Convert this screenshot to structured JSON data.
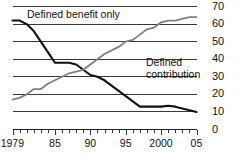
{
  "chart_data": {
    "type": "line",
    "title": "",
    "subtitle": "",
    "xlabel": "",
    "ylabel": "",
    "xlim": [
      1979,
      2005
    ],
    "ylim": [
      0,
      70
    ],
    "grid": true,
    "legend_position": "inline-annotation",
    "y_ticks": [
      70,
      60,
      50,
      40,
      30,
      20,
      10,
      0
    ],
    "x_ticks": [
      1979,
      1980,
      1981,
      1982,
      1983,
      1984,
      1985,
      1986,
      1987,
      1988,
      1989,
      1990,
      1991,
      1992,
      1993,
      1994,
      1995,
      1996,
      1997,
      1998,
      1999,
      2000,
      2001,
      2002,
      2003,
      2004,
      2005
    ],
    "x_tick_labels": [
      "1979",
      "85",
      "90",
      "95",
      "2000",
      "05"
    ],
    "x_tick_label_years": [
      1979,
      1985,
      1990,
      1995,
      2000,
      2005
    ],
    "annotations": [
      {
        "name": "defined-benefit-label",
        "text": "Defined benefit only",
        "x": 1980.5,
        "y": 66
      },
      {
        "name": "defined-contribution-label",
        "text": "Defined contribution",
        "lines": [
          "Defined",
          "contribution"
        ],
        "x": 1995,
        "y": 42
      }
    ],
    "series": [
      {
        "name": "Defined benefit only",
        "color": "#111111",
        "x": [
          1979,
          1980,
          1981,
          1982,
          1983,
          1984,
          1985,
          1986,
          1987,
          1988,
          1989,
          1990,
          1991,
          1992,
          1993,
          1994,
          1995,
          1996,
          1997,
          1998,
          1999,
          2000,
          2001,
          2002,
          2003,
          2004,
          2005
        ],
        "values": [
          62,
          62,
          60,
          56,
          50,
          44,
          38,
          38,
          38,
          37,
          34,
          31,
          30,
          28,
          25,
          22,
          19,
          16,
          13,
          13,
          13,
          13,
          13.5,
          13,
          12,
          11,
          10
        ]
      },
      {
        "name": "Defined contribution",
        "color": "#808080",
        "x": [
          1979,
          1980,
          1981,
          1982,
          1983,
          1984,
          1985,
          1986,
          1987,
          1988,
          1989,
          1990,
          1991,
          1992,
          1993,
          1994,
          1995,
          1996,
          1997,
          1998,
          1999,
          2000,
          2001,
          2002,
          2003,
          2004,
          2005
        ],
        "values": [
          17,
          18,
          20,
          23,
          23,
          26,
          28,
          30,
          32,
          33,
          34,
          37,
          40,
          43,
          45,
          47,
          50,
          51,
          54,
          57,
          58,
          61,
          62,
          62,
          63,
          64,
          64
        ]
      }
    ]
  }
}
